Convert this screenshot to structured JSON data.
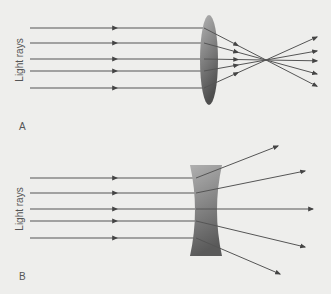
{
  "panels": [
    {
      "id": "A",
      "letter": "A",
      "axis_label": "Light rays",
      "lens_type": "converging (convex)",
      "ray_count": 5,
      "ray_behavior": "rays converge to a focal point behind the lens then diverge"
    },
    {
      "id": "B",
      "letter": "B",
      "axis_label": "Light rays",
      "lens_type": "diverging (concave)",
      "ray_count": 5,
      "ray_behavior": "rays spread apart after passing through the lens"
    }
  ],
  "colors": {
    "background": "#eeeeec",
    "ray": "#555555",
    "text": "#555555",
    "lens_light": "#b0b0b0",
    "lens_dark": "#5a5a5a"
  }
}
